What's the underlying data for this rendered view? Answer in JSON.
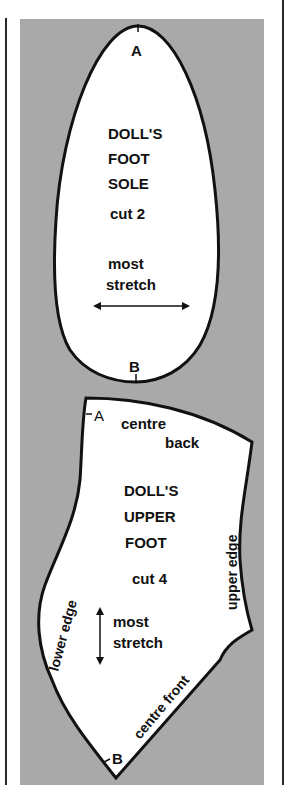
{
  "colors": {
    "panel": "#a9a9a9",
    "piece_fill": "#ffffff",
    "outline": "#111111"
  },
  "sole": {
    "point_top": "A",
    "point_bottom": "B",
    "title_lines": [
      "DOLL'S",
      "FOOT",
      "SOLE"
    ],
    "cut": "cut 2",
    "stretch_lines": [
      "most",
      "stretch"
    ],
    "stretch_direction": "horizontal"
  },
  "upper": {
    "point_top": "A",
    "point_bottom": "B",
    "centre_back_lines": [
      "centre",
      "back"
    ],
    "title_lines": [
      "DOLL'S",
      "UPPER",
      "FOOT"
    ],
    "cut": "cut 4",
    "stretch_lines": [
      "most",
      "stretch"
    ],
    "stretch_direction": "vertical",
    "upper_edge": "upper edge",
    "lower_edge": "lower edge",
    "centre_front": "centre front"
  }
}
